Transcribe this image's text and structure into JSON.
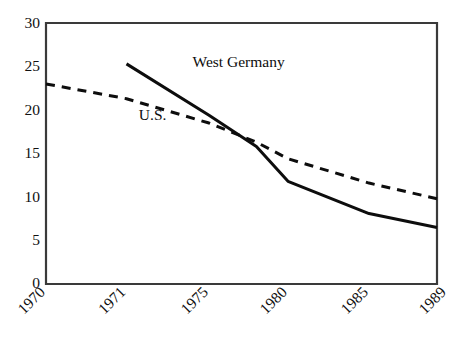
{
  "chart_data": {
    "type": "line",
    "title": "",
    "subtitle": "",
    "xlabel": "",
    "ylabel": "",
    "xlim": [
      1970,
      1989
    ],
    "ylim": [
      0,
      30
    ],
    "grid": false,
    "legend_position": "inline-annotation",
    "x_tick_labels": [
      "1970",
      "1971",
      "1975",
      "1980",
      "1985",
      "1989"
    ],
    "x_tick_values": [
      1970,
      1971,
      1975,
      1980,
      1985,
      1989
    ],
    "y_tick_labels": [
      "0",
      "5",
      "10",
      "15",
      "20",
      "25",
      "30"
    ],
    "y_tick_values": [
      0,
      5,
      10,
      15,
      20,
      25,
      30
    ],
    "series": [
      {
        "name": "U.S.",
        "style": "dashed",
        "color": "#0d0d0d",
        "annotation": "U.S.",
        "annotation_x": 1971.6,
        "annotation_y": 19.3,
        "x": [
          1970,
          1971,
          1975,
          1978,
          1980,
          1985,
          1989
        ],
        "values": [
          23.0,
          21.3,
          18.5,
          16.3,
          14.4,
          11.6,
          9.8
        ]
      },
      {
        "name": "West Germany",
        "style": "solid",
        "color": "#0d0d0d",
        "annotation": "West Germany",
        "annotation_x": 1974.2,
        "annotation_y": 25.3,
        "x": [
          1971,
          1975,
          1978,
          1980,
          1985,
          1989
        ],
        "values": [
          25.3,
          19.4,
          15.8,
          11.8,
          8.1,
          6.5
        ]
      }
    ],
    "crossover": {
      "approx_year": 1978.2,
      "approx_value": 16.0
    }
  },
  "axes": {
    "y_labels": [
      "30",
      "25",
      "20",
      "15",
      "10",
      "5",
      "0"
    ],
    "x_labels": [
      "1970",
      "1971",
      "1975",
      "1980",
      "1985",
      "1989"
    ]
  },
  "annotations": {
    "west_germany": "West Germany",
    "us": "U.S."
  },
  "colors": {
    "line": "#0d0d0d",
    "axis": "#3a3a3a",
    "background": "#ffffff",
    "text": "#111111"
  }
}
